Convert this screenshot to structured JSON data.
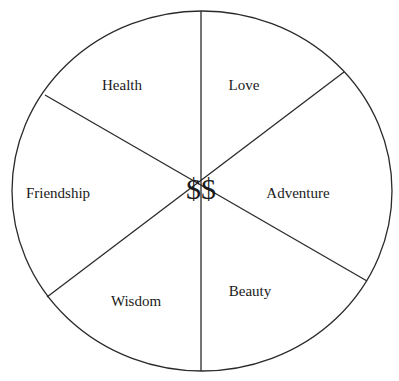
{
  "diagram": {
    "type": "segmented-circle",
    "center_label": "$$",
    "segments": [
      {
        "name": "love",
        "label": "Love"
      },
      {
        "name": "adventure",
        "label": "Adventure"
      },
      {
        "name": "beauty",
        "label": "Beauty"
      },
      {
        "name": "wisdom",
        "label": "Wisdom"
      },
      {
        "name": "friendship",
        "label": "Friendship"
      },
      {
        "name": "health",
        "label": "Health"
      }
    ],
    "colors": {
      "stroke": "#2a2a2a",
      "text": "#1a1a1a",
      "background": "#ffffff"
    }
  }
}
